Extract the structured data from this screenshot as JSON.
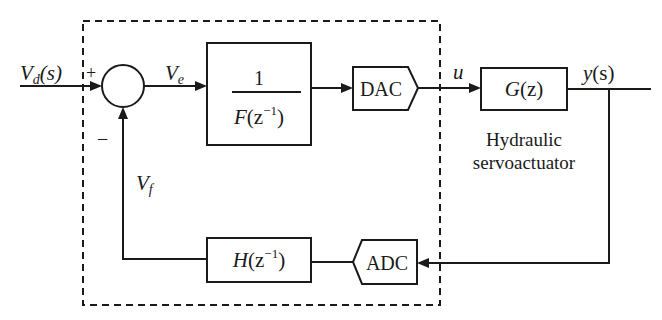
{
  "diagram": {
    "type": "block-diagram",
    "signals": {
      "input": "V",
      "input_sub": "d",
      "input_arg": "(s)",
      "error": "V",
      "error_sub": "e",
      "feedback": "V",
      "feedback_sub": "f",
      "control": "u",
      "output": "y",
      "output_arg": "(s)"
    },
    "summing_junction": {
      "plus_sign": "+",
      "minus_sign": "−"
    },
    "blocks": {
      "controller": {
        "numerator": "1",
        "denominator_F": "F",
        "denominator_arg_open": "(z",
        "denominator_exp": "−1",
        "denominator_arg_close": ")"
      },
      "dac": {
        "label": "DAC"
      },
      "plant": {
        "label_G": "G",
        "label_arg": "(z)"
      },
      "plant_caption": {
        "line1": "Hydraulic",
        "line2": "servoactuator"
      },
      "adc": {
        "label": "ADC"
      },
      "feedback_filter": {
        "label_H": "H",
        "label_arg_open": "(z",
        "label_exp": "−1",
        "label_arg_close": ")"
      }
    },
    "colors": {
      "line": "#1a1a1a",
      "background": "#ffffff"
    }
  }
}
